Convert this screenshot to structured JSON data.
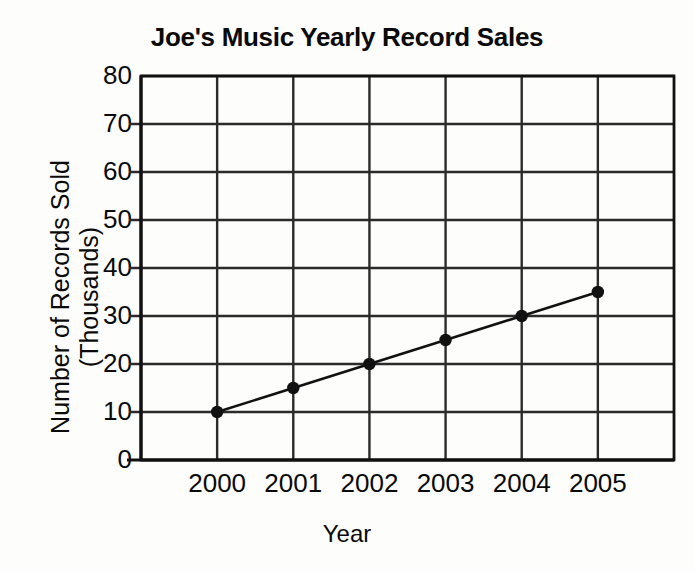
{
  "chart_data": {
    "type": "line",
    "title": "Joe's Music Yearly Record Sales",
    "xlabel": "Year",
    "ylabel": "Number of Records Sold (Thousands)",
    "ylabel_line1": "Number of Records Sold",
    "ylabel_line2": "(Thousands)",
    "categories": [
      "2000",
      "2001",
      "2002",
      "2003",
      "2004",
      "2005"
    ],
    "x": [
      2000,
      2001,
      2002,
      2003,
      2004,
      2005
    ],
    "values": [
      10,
      15,
      20,
      25,
      30,
      35
    ],
    "series": [
      {
        "name": "Records Sold",
        "values": [
          10,
          15,
          20,
          25,
          30,
          35
        ]
      }
    ],
    "ylim": [
      0,
      80
    ],
    "ytick_labels": [
      "80",
      "70",
      "60",
      "50",
      "40",
      "30",
      "20",
      "10",
      "0"
    ],
    "yticks": [
      80,
      70,
      60,
      50,
      40,
      30,
      20,
      10,
      0
    ],
    "ytick_step": 10,
    "grid": true,
    "grid_x": true,
    "grid_y": true,
    "legend": "none",
    "marker": "filled-circle",
    "line_color": "#111111",
    "marker_color": "#111111",
    "grid_color": "#2b2b2b",
    "axis_color": "#111111",
    "background": "#fdfdfb"
  }
}
